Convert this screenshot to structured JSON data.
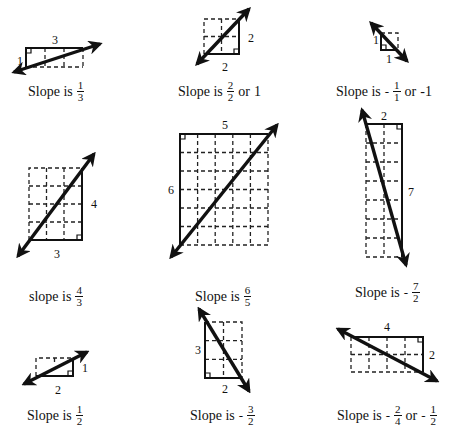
{
  "panels": [
    {
      "id": "p1",
      "rise_label": "1",
      "run_label": "3",
      "caption": {
        "prefix": "Slope is",
        "sign": "",
        "num": "1",
        "den": "3",
        "or_text": "",
        "alt_sign": "",
        "alt_num": "",
        "alt_den": "",
        "alt_value": ""
      },
      "slope": "1/3"
    },
    {
      "id": "p2",
      "rise_label": "2",
      "run_label": "2",
      "caption": {
        "prefix": "Slope is",
        "sign": "",
        "num": "2",
        "den": "2",
        "or_text": "or",
        "alt_sign": "",
        "alt_num": "",
        "alt_den": "",
        "alt_value": "1"
      },
      "slope": "2/2 = 1"
    },
    {
      "id": "p3",
      "rise_label": "1",
      "run_label": "1",
      "caption": {
        "prefix": "Slope is",
        "sign": "-",
        "num": "1",
        "den": "1",
        "or_text": "or",
        "alt_sign": "",
        "alt_num": "",
        "alt_den": "",
        "alt_value": "-1"
      },
      "slope": "-1/1 = -1"
    },
    {
      "id": "p4",
      "rise_label": "4",
      "run_label": "3",
      "caption": {
        "prefix": "slope is",
        "sign": "",
        "num": "4",
        "den": "3",
        "or_text": "",
        "alt_sign": "",
        "alt_num": "",
        "alt_den": "",
        "alt_value": ""
      },
      "slope": "4/3"
    },
    {
      "id": "p5",
      "rise_label": "6",
      "run_label": "5",
      "caption": {
        "prefix": "Slope is",
        "sign": "",
        "num": "6",
        "den": "5",
        "or_text": "",
        "alt_sign": "",
        "alt_num": "",
        "alt_den": "",
        "alt_value": ""
      },
      "slope": "6/5"
    },
    {
      "id": "p6",
      "rise_label": "7",
      "run_label": "2",
      "caption": {
        "prefix": "Slope is",
        "sign": "-",
        "num": "7",
        "den": "2",
        "or_text": "",
        "alt_sign": "",
        "alt_num": "",
        "alt_den": "",
        "alt_value": ""
      },
      "slope": "-7/2"
    },
    {
      "id": "p7",
      "rise_label": "1",
      "run_label": "2",
      "caption": {
        "prefix": "Slope is",
        "sign": "",
        "num": "1",
        "den": "2",
        "or_text": "",
        "alt_sign": "",
        "alt_num": "",
        "alt_den": "",
        "alt_value": ""
      },
      "slope": "1/2"
    },
    {
      "id": "p8",
      "rise_label": "3",
      "run_label": "2",
      "caption": {
        "prefix": "Slope is",
        "sign": "-",
        "num": "3",
        "den": "2",
        "or_text": "",
        "alt_sign": "",
        "alt_num": "",
        "alt_den": "",
        "alt_value": ""
      },
      "slope": "-3/2"
    },
    {
      "id": "p9",
      "rise_label": "2",
      "run_label": "4",
      "caption": {
        "prefix": "Slope is",
        "sign": "-",
        "num": "2",
        "den": "4",
        "or_text": "or",
        "alt_sign": "-",
        "alt_num": "1",
        "alt_den": "2",
        "alt_value": ""
      },
      "slope": "-2/4 = -1/2"
    }
  ],
  "colors": {
    "ink": "#111111",
    "background": "#ffffff"
  }
}
